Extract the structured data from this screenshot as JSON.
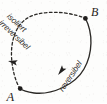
{
  "figure": {
    "kind": "thermodynamic-cycle-diagram",
    "background_color": "#fdfdfc",
    "ink_color": "#262422"
  },
  "states": [
    {
      "id": "state-a",
      "label": "A",
      "point": {
        "x": 20,
        "y": 88
      },
      "marker": "filled-dot",
      "label_position": {
        "x": 8,
        "y": 99
      }
    },
    {
      "id": "state-b",
      "label": "B",
      "point": {
        "x": 85,
        "y": 18
      },
      "marker": "filled-dot",
      "label_position": {
        "x": 92,
        "y": 14
      }
    }
  ],
  "paths": [
    {
      "id": "path-irreversible",
      "style": "dashed",
      "from": "A",
      "to": "B",
      "direction": "A-to-B",
      "labels": [
        "isoliert",
        "irreversibel"
      ],
      "label_rotation_deg": -47,
      "stroke_color": "#2b2926",
      "stroke_width": 1.35,
      "dash_pattern": "2.6 2.4"
    },
    {
      "id": "path-reversible",
      "style": "solid",
      "from": "B",
      "to": "A",
      "direction": "B-to-A",
      "labels": [
        "reversibel"
      ],
      "label_rotation_deg": -56,
      "stroke_color": "#2b2926",
      "stroke_width": 1.35
    }
  ],
  "arrows": [
    {
      "id": "arrow-irreversible",
      "on_path": "path-irreversible",
      "at": {
        "x": 13,
        "y": 62
      },
      "points_toward": "B",
      "rotation_deg": -62
    },
    {
      "id": "arrow-reversible",
      "on_path": "path-reversible",
      "at": {
        "x": 61,
        "y": 70
      },
      "points_toward": "A",
      "rotation_deg": 214
    }
  ],
  "ellipse": {
    "center": {
      "x": 52.5,
      "y": 53
    },
    "radius_x": 21,
    "radius_y": 45,
    "rotation_deg": 35
  }
}
